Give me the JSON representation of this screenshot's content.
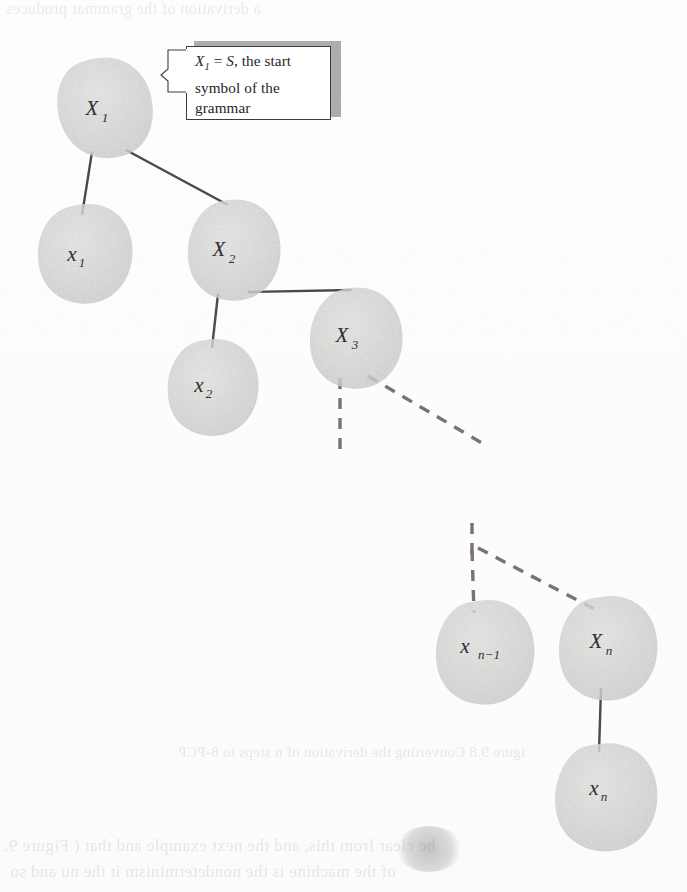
{
  "figure": {
    "type": "derivation-tree"
  },
  "callout": {
    "line1_prefix": "X",
    "line1_sub": "1",
    "line1_rest": " = S, the start",
    "line2": "symbol of the",
    "line3": "grammar",
    "plain_text": "X1 = S, the start symbol of the grammar"
  },
  "nodes": [
    {
      "id": "X1",
      "main": "X",
      "sub": "1",
      "kind": "nonterminal",
      "cx": 98,
      "cy": 108
    },
    {
      "id": "x1",
      "main": "x",
      "sub": "1",
      "kind": "terminal",
      "cx": 78,
      "cy": 253
    },
    {
      "id": "X2",
      "main": "X",
      "sub": "2",
      "kind": "nonterminal",
      "cx": 225,
      "cy": 250
    },
    {
      "id": "x2",
      "main": "x",
      "sub": "2",
      "kind": "terminal",
      "cx": 205,
      "cy": 384
    },
    {
      "id": "X3",
      "main": "X",
      "sub": "3",
      "kind": "nonterminal",
      "cx": 348,
      "cy": 335
    },
    {
      "id": "xn-1",
      "main": "x",
      "sub": "n−1",
      "kind": "terminal",
      "cx": 479,
      "cy": 646
    },
    {
      "id": "Xn",
      "main": "X",
      "sub": "n",
      "kind": "nonterminal",
      "cx": 602,
      "cy": 642
    },
    {
      "id": "xn",
      "main": "x",
      "sub": "n",
      "kind": "terminal",
      "cx": 600,
      "cy": 788
    }
  ],
  "edges": [
    {
      "from": "X1",
      "to": "x1",
      "style": "solid"
    },
    {
      "from": "X1",
      "to": "X2",
      "style": "solid"
    },
    {
      "from": "X2",
      "to": "x2",
      "style": "solid"
    },
    {
      "from": "X2",
      "to": "X3",
      "style": "solid"
    },
    {
      "from": "X3",
      "to": "continuation-down",
      "style": "dashed"
    },
    {
      "from": "X3",
      "to": "continuation-right",
      "style": "dashed"
    },
    {
      "from": "continuation",
      "to": "xn-1",
      "style": "dashed"
    },
    {
      "from": "continuation",
      "to": "Xn",
      "style": "dashed"
    },
    {
      "from": "Xn",
      "to": "xn",
      "style": "solid"
    }
  ],
  "ghost_text": {
    "caption": "igure 9.8  Converting the derivation of n steps to 8-PCP",
    "body_line1": "be clear from this, and the next example and that ( Figure 9.",
    "body_line2": "of the machine is the nondeterminism it the nu      and so",
    "top_line": "a derivation of the grammar produces"
  },
  "colors": {
    "node_fill": "#d7d7d5",
    "node_fill_light": "#e0e0de",
    "edge_solid": "#4a4a4d",
    "edge_dashed": "#7b7076",
    "callout_shadow": "#8e8e90",
    "text": "#2e2e31",
    "paper": "#fdfdfb"
  }
}
